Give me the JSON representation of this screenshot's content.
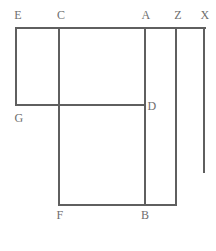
{
  "figure": {
    "name": "rectilinear-polygon-diagram",
    "type": "line-diagram",
    "width": 216,
    "height": 251,
    "background_color": "#ffffff",
    "stroke_color": "#5f5f5f",
    "stroke_width": 1.4,
    "label_color": "#6e6e6e",
    "label_font_size": 12,
    "vertices": [
      {
        "id": "E",
        "label": "E",
        "label_x": 18,
        "label_y": 15,
        "point_x": 16,
        "point_y": 28
      },
      {
        "id": "C",
        "label": "C",
        "label_x": 61,
        "label_y": 15,
        "point_x": 59,
        "point_y": 28
      },
      {
        "id": "A",
        "label": "A",
        "label_x": 146,
        "label_y": 15,
        "point_x": 145,
        "point_y": 28
      },
      {
        "id": "Z",
        "label": "Z",
        "label_x": 178,
        "label_y": 15,
        "point_x": 176,
        "point_y": 28
      },
      {
        "id": "X",
        "label": "X",
        "label_x": 205,
        "label_y": 15,
        "point_x": 204,
        "point_y": 28
      },
      {
        "id": "D",
        "label": "D",
        "label_x": 152,
        "label_y": 106,
        "point_x": 145,
        "point_y": 105
      },
      {
        "id": "G",
        "label": "G",
        "label_x": 19,
        "label_y": 118,
        "point_x": 16,
        "point_y": 105
      },
      {
        "id": "F",
        "label": "F",
        "label_x": 60,
        "label_y": 215,
        "point_x": 59,
        "point_y": 205
      },
      {
        "id": "B",
        "label": "B",
        "label_x": 145,
        "label_y": 215,
        "point_x": 145,
        "point_y": 205
      }
    ],
    "segments": [
      {
        "name": "top-edge-E-to-X",
        "orientation": "horizontal",
        "x1": 16,
        "y1": 28,
        "x2": 205,
        "y2": 28
      },
      {
        "name": "left-edge-E-to-G",
        "orientation": "vertical",
        "x1": 16,
        "y1": 28,
        "x2": 16,
        "y2": 105
      },
      {
        "name": "vertical-edge-C-to-F",
        "orientation": "vertical",
        "x1": 59,
        "y1": 28,
        "x2": 59,
        "y2": 205
      },
      {
        "name": "vertical-edge-A-to-B",
        "orientation": "vertical",
        "x1": 145,
        "y1": 28,
        "x2": 145,
        "y2": 205
      },
      {
        "name": "vertical-edge-Z-to-bottom",
        "orientation": "vertical",
        "x1": 176,
        "y1": 28,
        "x2": 176,
        "y2": 205
      },
      {
        "name": "vertical-edge-X-ray",
        "orientation": "vertical",
        "x1": 204,
        "y1": 28,
        "x2": 204,
        "y2": 172
      },
      {
        "name": "horizontal-edge-G-to-D",
        "orientation": "horizontal",
        "x1": 16,
        "y1": 105,
        "x2": 145,
        "y2": 105
      },
      {
        "name": "bottom-edge-F-to-Z",
        "orientation": "horizontal",
        "x1": 59,
        "y1": 205,
        "x2": 176,
        "y2": 205
      }
    ]
  }
}
